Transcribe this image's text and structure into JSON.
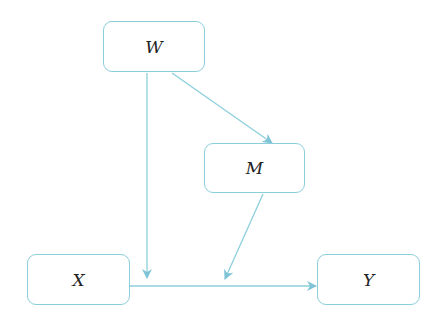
{
  "diagram": {
    "colors": {
      "stroke": "#8ccfdc",
      "arrow": "#7fc3d6",
      "text": "#222222"
    },
    "nodes": [
      {
        "id": "W",
        "label": "W"
      },
      {
        "id": "M",
        "label": "M"
      },
      {
        "id": "X",
        "label": "X"
      },
      {
        "id": "Y",
        "label": "Y"
      }
    ],
    "edges": [
      {
        "from": "W",
        "to": "M"
      },
      {
        "from": "W",
        "to": "X-Y path"
      },
      {
        "from": "M",
        "to": "X-Y path"
      },
      {
        "from": "X",
        "to": "Y"
      }
    ]
  }
}
